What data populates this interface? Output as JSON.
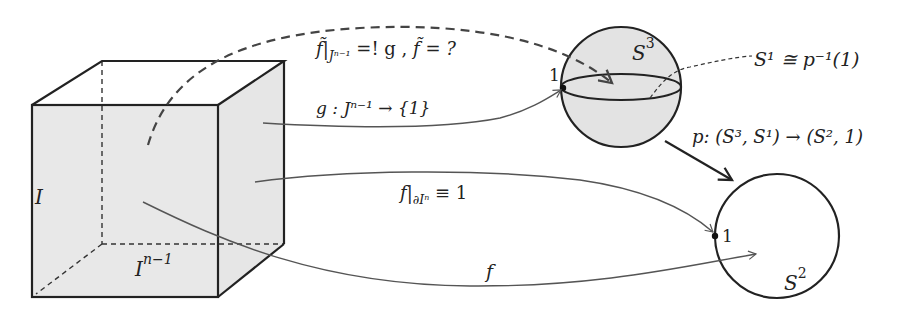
{
  "diagram": {
    "colors": {
      "stroke": "#222222",
      "arrow": "#555555",
      "fill": "#e6e6e6",
      "background": "#ffffff"
    },
    "cube": {
      "label_side": "I",
      "label_bottom_base": "I",
      "label_bottom_sup": "n−1"
    },
    "sphere_s3": {
      "label_base": "S",
      "label_sup": "3",
      "point_label": "1",
      "fiber_label": "S¹ ≅ p⁻¹(1)"
    },
    "circle_s2": {
      "label_base": "S",
      "label_sup": "2",
      "point_label": "1"
    },
    "arrows": {
      "lift_question": "f̃|Jⁿ⁻¹ =! g ,   f̃ = ?",
      "lift_lhs": "f̃|",
      "lift_sub": "Jⁿ⁻¹",
      "lift_eq": " =! g ,   ",
      "lift_rhs": "f̃ = ?",
      "g_map": "g : Jⁿ⁻¹ → {1}",
      "boundary_map": "f|∂Iⁿ ≡ 1",
      "boundary_lhs": "f|",
      "boundary_sub": "∂Iⁿ",
      "boundary_rhs": " ≡ 1",
      "f_map": "f",
      "projection": "p: (S³, S¹) → (S², 1)"
    }
  }
}
